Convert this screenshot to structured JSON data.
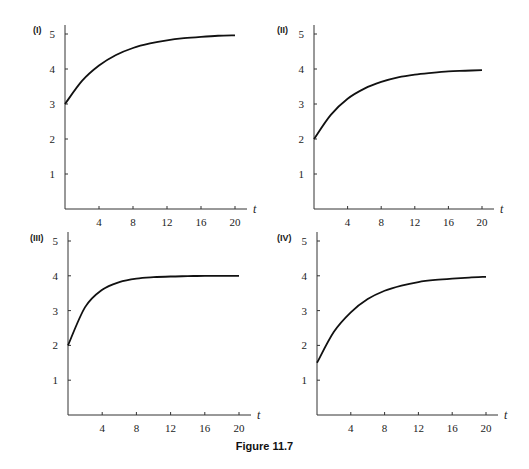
{
  "caption": "Figure 11.7",
  "chart_data": [
    {
      "type": "line",
      "panel": "(I)",
      "xlabel": "t",
      "ylabel": "",
      "xticks": [
        4,
        8,
        12,
        16,
        20
      ],
      "yticks": [
        1,
        2,
        3,
        4,
        5
      ],
      "xlim": [
        0,
        20
      ],
      "ylim": [
        0,
        5
      ],
      "grid": false,
      "x": [
        0,
        2,
        4,
        6,
        8,
        10,
        12,
        14,
        16,
        18,
        20
      ],
      "series": [
        {
          "name": "(I)",
          "values": [
            3.0,
            3.66,
            4.1,
            4.4,
            4.6,
            4.73,
            4.82,
            4.88,
            4.92,
            4.95,
            4.96
          ]
        }
      ]
    },
    {
      "type": "line",
      "panel": "(II)",
      "xlabel": "t",
      "ylabel": "",
      "xticks": [
        4,
        8,
        12,
        16,
        20
      ],
      "yticks": [
        1,
        2,
        3,
        4,
        5
      ],
      "xlim": [
        0,
        20
      ],
      "ylim": [
        0,
        5
      ],
      "grid": false,
      "x": [
        0,
        2,
        4,
        6,
        8,
        10,
        12,
        14,
        16,
        18,
        20
      ],
      "series": [
        {
          "name": "(II)",
          "values": [
            2.0,
            2.69,
            3.15,
            3.44,
            3.63,
            3.76,
            3.84,
            3.89,
            3.93,
            3.95,
            3.97
          ]
        }
      ]
    },
    {
      "type": "line",
      "panel": "(III)",
      "xlabel": "t",
      "ylabel": "",
      "xticks": [
        4,
        8,
        12,
        16,
        20
      ],
      "yticks": [
        1,
        2,
        3,
        4,
        5
      ],
      "xlim": [
        0,
        20
      ],
      "ylim": [
        0,
        5
      ],
      "grid": false,
      "x": [
        0,
        2,
        4,
        6,
        8,
        10,
        12,
        14,
        16,
        18,
        20
      ],
      "series": [
        {
          "name": "(III)",
          "values": [
            2.0,
            3.1,
            3.6,
            3.82,
            3.92,
            3.96,
            3.98,
            3.99,
            4.0,
            4.0,
            4.0
          ]
        }
      ]
    },
    {
      "type": "line",
      "panel": "(IV)",
      "xlabel": "t",
      "ylabel": "",
      "xticks": [
        4,
        8,
        12,
        16,
        20
      ],
      "yticks": [
        1,
        2,
        3,
        4,
        5
      ],
      "xlim": [
        0,
        20
      ],
      "ylim": [
        0,
        5
      ],
      "grid": false,
      "x": [
        0,
        2,
        4,
        6,
        8,
        10,
        12,
        14,
        16,
        18,
        20
      ],
      "series": [
        {
          "name": "(IV)",
          "values": [
            1.5,
            2.39,
            2.95,
            3.33,
            3.57,
            3.72,
            3.82,
            3.88,
            3.92,
            3.95,
            3.97
          ]
        }
      ]
    }
  ]
}
